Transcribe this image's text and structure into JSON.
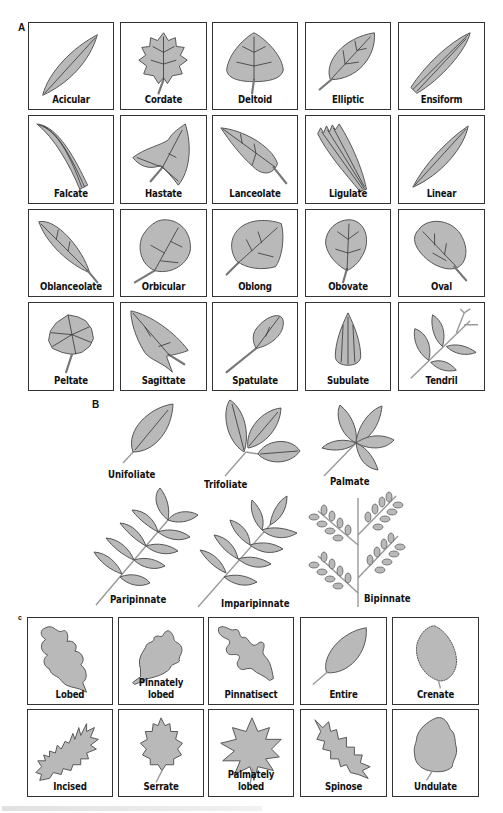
{
  "figure": {
    "colors": {
      "leaf_fill": "#b9b9b9",
      "leaf_stroke": "#555555",
      "vein": "#333333",
      "box_border": "#333333"
    },
    "section_a": {
      "label": "A",
      "items": [
        {
          "label": "Acicular",
          "icon": "acicular-leaf"
        },
        {
          "label": "Cordate",
          "icon": "cordate-leaf"
        },
        {
          "label": "Deltoid",
          "icon": "deltoid-leaf"
        },
        {
          "label": "Elliptic",
          "icon": "elliptic-leaf"
        },
        {
          "label": "Ensiform",
          "icon": "ensiform-leaf"
        },
        {
          "label": "Falcate",
          "icon": "falcate-leaf"
        },
        {
          "label": "Hastate",
          "icon": "hastate-leaf"
        },
        {
          "label": "Lanceolate",
          "icon": "lanceolate-leaf"
        },
        {
          "label": "Ligulate",
          "icon": "ligulate-leaf"
        },
        {
          "label": "Linear",
          "icon": "linear-leaf"
        },
        {
          "label": "Oblanceolate",
          "icon": "oblanceolate-leaf"
        },
        {
          "label": "Orbicular",
          "icon": "orbicular-leaf"
        },
        {
          "label": "Oblong",
          "icon": "oblong-leaf"
        },
        {
          "label": "Obovate",
          "icon": "obovate-leaf"
        },
        {
          "label": "Oval",
          "icon": "oval-leaf"
        },
        {
          "label": "Peltate",
          "icon": "peltate-leaf"
        },
        {
          "label": "Sagittate",
          "icon": "sagittate-leaf"
        },
        {
          "label": "Spatulate",
          "icon": "spatulate-leaf"
        },
        {
          "label": "Subulate",
          "icon": "subulate-leaf"
        },
        {
          "label": "Tendril",
          "icon": "tendril-leaf"
        }
      ]
    },
    "section_b": {
      "label": "B",
      "items": [
        {
          "label": "Unifoliate"
        },
        {
          "label": "Trifoliate"
        },
        {
          "label": "Palmate"
        },
        {
          "label": "Paripinnate"
        },
        {
          "label": "Imparipinnate"
        },
        {
          "label": "Bipinnate"
        }
      ]
    },
    "section_c": {
      "label": "c",
      "items": [
        {
          "label": "Lobed"
        },
        {
          "label": "Pinnately lobed"
        },
        {
          "label": "Pinnatisect"
        },
        {
          "label": "Entire"
        },
        {
          "label": "Crenate"
        },
        {
          "label": "Incised"
        },
        {
          "label": "Serrate"
        },
        {
          "label": "Palmately lobed"
        },
        {
          "label": "Spinose"
        },
        {
          "label": "Undulate"
        }
      ]
    }
  }
}
